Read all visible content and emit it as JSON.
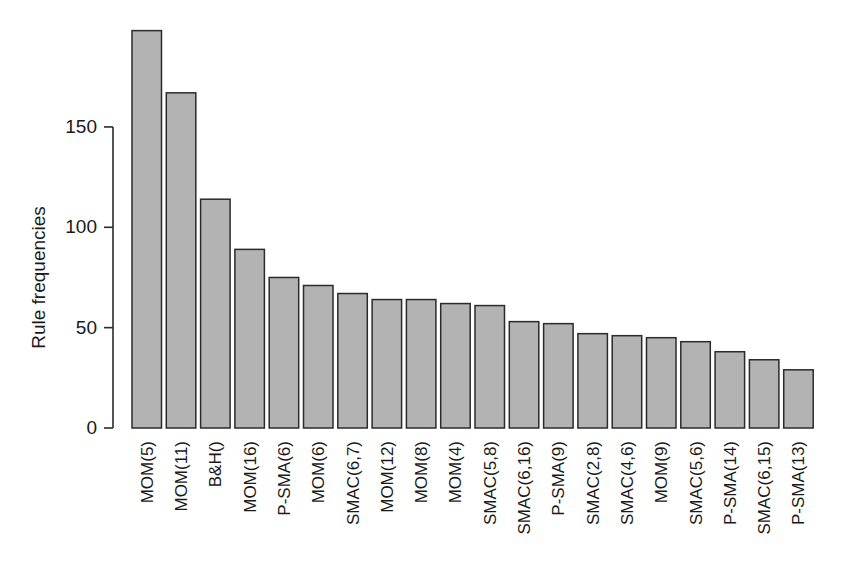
{
  "chart_data": {
    "type": "bar",
    "title": "",
    "subtitle": "",
    "xlabel": "",
    "ylabel": "Rule frequencies",
    "ylim": [
      0,
      205
    ],
    "yticks": [
      0,
      50,
      100,
      150
    ],
    "ytick_labels": [
      "0",
      "50",
      "100",
      "150"
    ],
    "grid": false,
    "legend": false,
    "legend_position": "none",
    "bar_fill_color": "#b3b3b3",
    "bar_border_color": "#2b2b2b",
    "background_color": "#ffffff",
    "categories": [
      "MOM(5)",
      "MOM(11)",
      "B&H()",
      "MOM(16)",
      "P-SMA(6)",
      "MOM(6)",
      "SMAC(6,7)",
      "MOM(12)",
      "MOM(8)",
      "MOM(4)",
      "SMAC(5,8)",
      "SMAC(6,16)",
      "P-SMA(9)",
      "SMAC(2,8)",
      "SMAC(4,6)",
      "MOM(9)",
      "SMAC(5,6)",
      "P-SMA(14)",
      "SMAC(6,15)",
      "P-SMA(13)"
    ],
    "values": [
      198,
      167,
      114,
      89,
      75,
      71,
      67,
      64,
      64,
      62,
      61,
      53,
      52,
      47,
      46,
      45,
      43,
      38,
      34,
      29
    ]
  }
}
